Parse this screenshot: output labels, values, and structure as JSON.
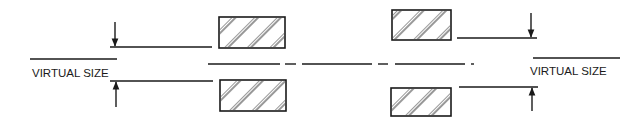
{
  "diagram": {
    "title": "",
    "labels": {
      "left_label": "VIRTUAL SIZE",
      "right_label": "VIRTUAL SIZE"
    },
    "elements": [
      {
        "id": "left-virtual-size",
        "type": "dimension",
        "label": "VIRTUAL SIZE",
        "side": "left"
      },
      {
        "id": "left-lens-top",
        "type": "hatched-rect",
        "position": "upper-left"
      },
      {
        "id": "left-lens-bottom",
        "type": "hatched-rect",
        "position": "lower-left"
      },
      {
        "id": "right-lens-top",
        "type": "hatched-rect",
        "position": "upper-right"
      },
      {
        "id": "right-lens-bottom",
        "type": "hatched-rect",
        "position": "lower-right"
      },
      {
        "id": "right-virtual-size",
        "type": "dimension",
        "label": "VIRTUAL SIZE",
        "side": "right"
      },
      {
        "id": "center-axis",
        "type": "dash-dot-line"
      }
    ],
    "colors": {
      "ink": "#1a1a1a",
      "background": "#ffffff"
    }
  }
}
